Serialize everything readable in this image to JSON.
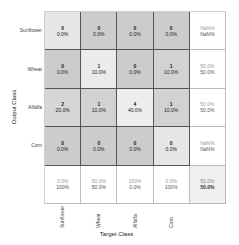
{
  "chart_data": {
    "type": "heatmap",
    "xlabel": "Target Class",
    "ylabel": "Output Class",
    "classes": [
      "Sunflower",
      "Wheat",
      "Alfalfa",
      "Corn"
    ],
    "matrix": [
      [
        0,
        0,
        0,
        0
      ],
      [
        0,
        1,
        0,
        1
      ],
      [
        2,
        1,
        4,
        1
      ],
      [
        0,
        0,
        0,
        0
      ]
    ],
    "matrix_percent": [
      [
        "0.0%",
        "0.0%",
        "0.0%",
        "0.0%"
      ],
      [
        "0.0%",
        "10.0%",
        "0.0%",
        "10.0%"
      ],
      [
        "20.0%",
        "10.0%",
        "40.0%",
        "10.0%"
      ],
      [
        "0.0%",
        "0.0%",
        "0.0%",
        "0.0%"
      ]
    ],
    "row_summary": [
      [
        "NaN%",
        "NaN%"
      ],
      [
        "50.0%",
        "50.0%"
      ],
      [
        "50.0%",
        "50.0%"
      ],
      [
        "NaN%",
        "NaN%"
      ]
    ],
    "col_summary": [
      [
        "0.0%",
        "100%"
      ],
      [
        "50.0%",
        "50.0%"
      ],
      [
        "100%",
        "0.0%"
      ],
      [
        "0.0%",
        "100%"
      ]
    ],
    "overall": [
      "50.0%",
      "50.0%"
    ],
    "colors": {
      "low": "#c8c8c8",
      "mid": "#d9d9d9",
      "high": "#ececec",
      "summary": "#ffffff",
      "overall": "#f0f0f0"
    }
  },
  "rows": [
    {
      "label": "Sunflower",
      "cells": [
        {
          "count": "0",
          "pct": "0.0%",
          "bg": "#e6e6e6"
        },
        {
          "count": "0",
          "pct": "0.0%",
          "bg": "#cccccc"
        },
        {
          "count": "0",
          "pct": "0.0%",
          "bg": "#cccccc"
        },
        {
          "count": "0",
          "pct": "0.0%",
          "bg": "#cccccc"
        }
      ],
      "summary": [
        "NaN%",
        "NaN%"
      ]
    },
    {
      "label": "Wheat",
      "cells": [
        {
          "count": "0",
          "pct": "0.0%",
          "bg": "#cccccc"
        },
        {
          "count": "1",
          "pct": "10.0%",
          "bg": "#ebebeb"
        },
        {
          "count": "0",
          "pct": "0.0%",
          "bg": "#cccccc"
        },
        {
          "count": "1",
          "pct": "10.0%",
          "bg": "#d2d2d2"
        }
      ],
      "summary": [
        "50.0%",
        "50.0%"
      ]
    },
    {
      "label": "Alfalfa",
      "cells": [
        {
          "count": "2",
          "pct": "20.0%",
          "bg": "#d6d6d6"
        },
        {
          "count": "1",
          "pct": "10.0%",
          "bg": "#d2d2d2"
        },
        {
          "count": "4",
          "pct": "40.0%",
          "bg": "#eeeeee"
        },
        {
          "count": "1",
          "pct": "10.0%",
          "bg": "#d2d2d2"
        }
      ],
      "summary": [
        "50.0%",
        "50.0%"
      ]
    },
    {
      "label": "Corn",
      "cells": [
        {
          "count": "0",
          "pct": "0.0%",
          "bg": "#cccccc"
        },
        {
          "count": "0",
          "pct": "0.0%",
          "bg": "#cccccc"
        },
        {
          "count": "0",
          "pct": "0.0%",
          "bg": "#cccccc"
        },
        {
          "count": "0",
          "pct": "0.0%",
          "bg": "#e6e6e6"
        }
      ],
      "summary": [
        "NaN%",
        "NaN%"
      ]
    }
  ],
  "col_summary": [
    [
      "0.0%",
      "100%"
    ],
    [
      "50.0%",
      "50.0%"
    ],
    [
      "100%",
      "0.0%"
    ],
    [
      "0.0%",
      "100%"
    ]
  ],
  "overall": [
    "50.0%",
    "50.0%"
  ],
  "x_labels": [
    "Sunflower",
    "Wheat",
    "Alfalfa",
    "Corn"
  ],
  "axis": {
    "x_title": "Target Class",
    "y_title": "Output Class"
  }
}
